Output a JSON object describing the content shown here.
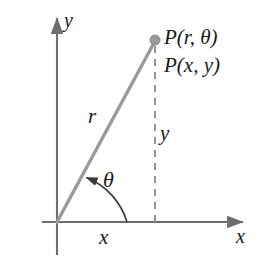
{
  "figure": {
    "background_color": "#ffffff",
    "width": 271,
    "height": 263
  },
  "colors": {
    "axis": "#6e6e6e",
    "ray": "#9a9a9a",
    "point_fill": "#9a9a9a",
    "point_stroke": "#8a8a8a",
    "dashed_line": "#8f8f8f",
    "arc": "#3a3a3a",
    "text": "#1a1a1a"
  },
  "axes": {
    "x_axis": {
      "label": "x",
      "arrow": "arrow-right",
      "origin_px": [
        57,
        222
      ],
      "end_px": [
        250,
        222
      ]
    },
    "y_axis": {
      "label": "y",
      "arrow": "arrow-up",
      "origin_px": [
        57,
        222
      ],
      "end_px": [
        57,
        12
      ]
    },
    "origin_px": [
      57,
      222
    ]
  },
  "point": {
    "label_polar": "P(r, θ)",
    "label_cartesian": "P(x, y)",
    "position_px": [
      155,
      40
    ],
    "marker": "filled-circle",
    "marker_radius_px": 5
  },
  "segments": {
    "radius": {
      "label": "r",
      "from_px": [
        57,
        222
      ],
      "to_px": [
        155,
        40
      ],
      "style": "solid"
    },
    "ordinate_drop": {
      "label": "y",
      "from_px": [
        155,
        40
      ],
      "to_px": [
        155,
        222
      ],
      "style": "dashed"
    },
    "abscissa": {
      "label": "x",
      "from_px": [
        57,
        222
      ],
      "to_px": [
        155,
        222
      ],
      "style": "implied"
    }
  },
  "angle": {
    "label": "θ",
    "vertex_px": [
      57,
      222
    ],
    "from_ray": "positive-x-axis",
    "to_ray": "radius",
    "arc_radius_px": 70,
    "arrow": "arrow-counterclockwise"
  }
}
